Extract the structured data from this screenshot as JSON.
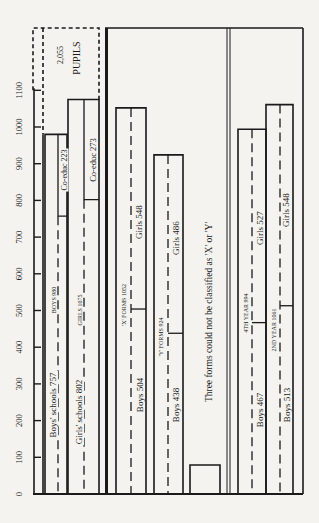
{
  "chart_data": {
    "type": "bar",
    "orientation": "vertical, printed rotated 90 degrees",
    "title": "",
    "ylabel": "",
    "ylim": [
      0,
      1100
    ],
    "yticks": [
      0,
      100,
      200,
      300,
      400,
      500,
      600,
      700,
      800,
      900,
      1000,
      1100
    ],
    "grid": false,
    "total_annotation": {
      "value": 2055,
      "label": "2,055",
      "unit": "PUPILS"
    },
    "groups": [
      {
        "name": "school type",
        "bars": [
          {
            "name": "Boys",
            "label": "BOYS 980",
            "total": 980,
            "segments": [
              {
                "name": "Boys' schools",
                "label": "Boys' schools 757",
                "value": 757
              },
              {
                "name": "Co-educ",
                "label": "Co-educ 223",
                "value": 223
              }
            ]
          },
          {
            "name": "Girls",
            "label": "GIRLS 1075",
            "total": 1075,
            "segments": [
              {
                "name": "Girls' schools",
                "label": "Girls' schools 802",
                "value": 802
              },
              {
                "name": "Co-educ",
                "label": "Co-educ 273",
                "value": 273
              }
            ]
          }
        ]
      },
      {
        "name": "form type",
        "bars": [
          {
            "name": "'X' forms",
            "label": "'X' FORMS 1052",
            "total": 1052,
            "segments": [
              {
                "name": "Boys",
                "label": "Boys 504",
                "value": 504
              },
              {
                "name": "Girls",
                "label": "Girls 548",
                "value": 548
              }
            ]
          },
          {
            "name": "'Y' forms",
            "label": "'Y' FORMS 924",
            "total": 924,
            "segments": [
              {
                "name": "Boys",
                "label": "Boys 438",
                "value": 438
              },
              {
                "name": "Girls",
                "label": "Girls 486",
                "value": 486
              }
            ]
          },
          {
            "name": "Unclassified",
            "label": "Three forms could not be classified as 'X' or 'Y'",
            "total": 79,
            "segments": []
          }
        ]
      },
      {
        "name": "year",
        "bars": [
          {
            "name": "4th year",
            "label": "4TH YEAR 994",
            "total": 994,
            "segments": [
              {
                "name": "Boys",
                "label": "Boys 467",
                "value": 467
              },
              {
                "name": "Girls",
                "label": "Girls 527",
                "value": 527
              }
            ]
          },
          {
            "name": "2nd year",
            "label": "2ND YEAR 1061",
            "total": 1061,
            "segments": [
              {
                "name": "Boys",
                "label": "Boys 513",
                "value": 513
              },
              {
                "name": "Girls",
                "label": "Girls 548",
                "value": 548
              }
            ]
          }
        ]
      }
    ]
  },
  "labels": {
    "pupils_total": "2,055",
    "pupils_word": "PUPILS",
    "boys_total": "BOYS 980",
    "girls_total": "GIRLS 1075",
    "boys_schools": "Boys' schools 757",
    "girls_schools": "Girls' schools 802",
    "boys_coeduc": "Co-educ  223",
    "girls_coeduc": "Co-educ  273",
    "x_forms": "'X' FORMS 1052",
    "y_forms": "'Y' FORMS 924",
    "x_boys": "Boys 504",
    "x_girls": "Girls 548",
    "y_boys": "Boys 438",
    "y_girls": "Girls 486",
    "unclassified": "Three forms could not be classified as 'X' or 'Y'",
    "year4": "4TH YEAR 994",
    "year2": "2ND YEAR 1061",
    "y4_boys": "Boys 467",
    "y4_girls": "Girls 527",
    "y2_boys": "Boys 513",
    "y2_girls": "Girls 548"
  },
  "tick_labels": [
    "0",
    "100",
    "200",
    "300",
    "400",
    "500",
    "600",
    "700",
    "800",
    "900",
    "1000",
    "1100"
  ]
}
